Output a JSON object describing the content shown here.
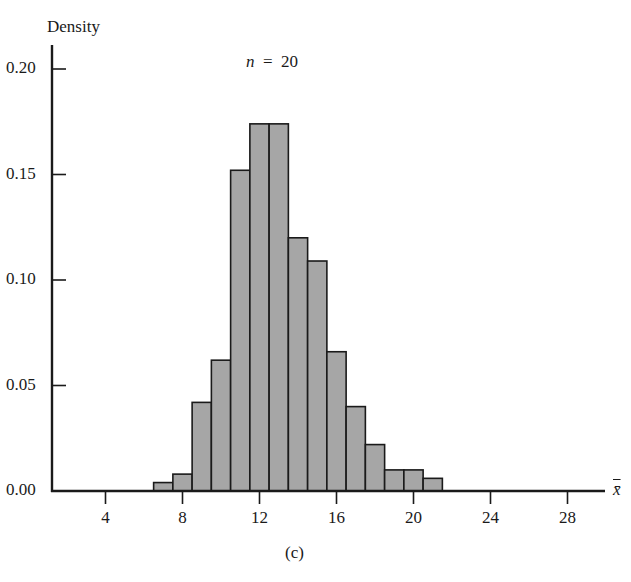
{
  "chart_data": {
    "type": "bar",
    "title_var": "n",
    "title_value": "20",
    "ylabel": "Density",
    "xlabel": "x̄",
    "caption": "(c)",
    "bin_width": 1,
    "bins": [
      {
        "left": 6.5,
        "right": 7.5,
        "density": 0.004
      },
      {
        "left": 7.5,
        "right": 8.5,
        "density": 0.008
      },
      {
        "left": 8.5,
        "right": 9.5,
        "density": 0.042
      },
      {
        "left": 9.5,
        "right": 10.5,
        "density": 0.062
      },
      {
        "left": 10.5,
        "right": 11.5,
        "density": 0.152
      },
      {
        "left": 11.5,
        "right": 12.5,
        "density": 0.174
      },
      {
        "left": 12.5,
        "right": 13.5,
        "density": 0.174
      },
      {
        "left": 13.5,
        "right": 14.5,
        "density": 0.12
      },
      {
        "left": 14.5,
        "right": 15.5,
        "density": 0.109
      },
      {
        "left": 15.5,
        "right": 16.5,
        "density": 0.066
      },
      {
        "left": 16.5,
        "right": 17.5,
        "density": 0.04
      },
      {
        "left": 17.5,
        "right": 18.5,
        "density": 0.022
      },
      {
        "left": 18.5,
        "right": 19.5,
        "density": 0.01
      },
      {
        "left": 19.5,
        "right": 20.5,
        "density": 0.01
      },
      {
        "left": 20.5,
        "right": 21.5,
        "density": 0.006
      }
    ],
    "categories": [
      "7",
      "8",
      "9",
      "10",
      "11",
      "12",
      "13",
      "14",
      "15",
      "16",
      "17",
      "18",
      "19",
      "20",
      "21"
    ],
    "values": [
      0.004,
      0.008,
      0.042,
      0.062,
      0.152,
      0.174,
      0.174,
      0.12,
      0.109,
      0.066,
      0.04,
      0.022,
      0.01,
      0.01,
      0.006
    ],
    "xticks": [
      4,
      8,
      12,
      16,
      20,
      24,
      28
    ],
    "xtick_labels": [
      "4",
      "8",
      "12",
      "16",
      "20",
      "24",
      "28"
    ],
    "yticks": [
      0.0,
      0.05,
      0.1,
      0.15,
      0.2
    ],
    "ytick_labels": [
      "0.00",
      "0.05",
      "0.10",
      "0.15",
      "0.20"
    ],
    "xlim": [
      1.0,
      29.8
    ],
    "ylim": [
      0,
      0.21
    ],
    "grid": false,
    "legend": null,
    "colors": {
      "bar_fill": "#a6a6a6",
      "bar_edge": "#1a1a1a",
      "axis": "#1a1a1a"
    }
  }
}
